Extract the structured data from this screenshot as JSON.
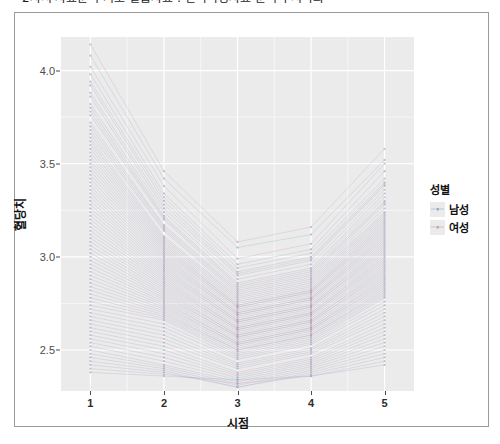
{
  "document": {
    "title_truncated": "2차시 자료분석 기초 실습자료 : 반복측정자료 분석과 시각화"
  },
  "figure": {
    "panel_background": "#ebebeb",
    "grid_color": "#ffffff",
    "border_color": "#9a9a9a"
  },
  "legend": {
    "title": "성별",
    "position": "right",
    "items": [
      {
        "label": "남성",
        "color": "#8aa8c8"
      },
      {
        "label": "여성",
        "color": "#c89aa8"
      }
    ]
  },
  "chart_data": {
    "type": "line",
    "title": "",
    "subtitle": "",
    "xlabel": "시점",
    "ylabel": "혈당치",
    "xlim": [
      0.6,
      5.4
    ],
    "ylim": [
      2.28,
      4.18
    ],
    "grid": true,
    "legend_position": "right",
    "x": [
      1,
      2,
      3,
      4,
      5
    ],
    "x_tick_labels": [
      "1",
      "2",
      "3",
      "4",
      "5"
    ],
    "y_ticks": [
      2.5,
      3.0,
      3.5,
      4.0
    ],
    "y_tick_labels": [
      "2.5",
      "3.0",
      "3.5",
      "4.0"
    ],
    "group_means": {
      "남성": [
        3.42,
        3.02,
        2.8,
        2.88,
        3.18
      ],
      "여성": [
        3.34,
        2.96,
        2.76,
        2.84,
        3.12
      ]
    },
    "series": [
      {
        "name": "남성",
        "values": [
          4.08,
          3.42,
          3.05,
          3.12,
          3.52
        ]
      },
      {
        "name": "남성",
        "values": [
          3.98,
          3.34,
          2.96,
          3.04,
          3.46
        ]
      },
      {
        "name": "남성",
        "values": [
          3.92,
          3.3,
          2.92,
          3.0,
          3.4
        ]
      },
      {
        "name": "남성",
        "values": [
          3.86,
          3.26,
          2.9,
          2.98,
          3.38
        ]
      },
      {
        "name": "남성",
        "values": [
          3.8,
          3.22,
          2.86,
          2.94,
          3.34
        ]
      },
      {
        "name": "남성",
        "values": [
          3.76,
          3.2,
          2.84,
          2.92,
          3.3
        ]
      },
      {
        "name": "남성",
        "values": [
          3.7,
          3.16,
          2.82,
          2.9,
          3.28
        ]
      },
      {
        "name": "남성",
        "values": [
          3.66,
          3.14,
          2.8,
          2.88,
          3.24
        ]
      },
      {
        "name": "남성",
        "values": [
          3.62,
          3.1,
          2.78,
          2.86,
          3.22
        ]
      },
      {
        "name": "남성",
        "values": [
          3.58,
          3.08,
          2.76,
          2.84,
          3.2
        ]
      },
      {
        "name": "남성",
        "values": [
          3.54,
          3.06,
          2.74,
          2.82,
          3.18
        ]
      },
      {
        "name": "남성",
        "values": [
          3.5,
          3.04,
          2.73,
          2.81,
          3.16
        ]
      },
      {
        "name": "남성",
        "values": [
          3.46,
          3.02,
          2.72,
          2.8,
          3.14
        ]
      },
      {
        "name": "남성",
        "values": [
          3.42,
          3.0,
          2.7,
          2.78,
          3.12
        ]
      },
      {
        "name": "남성",
        "values": [
          3.38,
          2.98,
          2.69,
          2.77,
          3.1
        ]
      },
      {
        "name": "남성",
        "values": [
          3.34,
          2.96,
          2.68,
          2.76,
          3.08
        ]
      },
      {
        "name": "남성",
        "values": [
          3.3,
          2.94,
          2.66,
          2.74,
          3.06
        ]
      },
      {
        "name": "남성",
        "values": [
          3.26,
          2.92,
          2.65,
          2.73,
          3.04
        ]
      },
      {
        "name": "남성",
        "values": [
          3.22,
          2.9,
          2.64,
          2.72,
          3.02
        ]
      },
      {
        "name": "남성",
        "values": [
          3.18,
          2.88,
          2.62,
          2.7,
          3.0
        ]
      },
      {
        "name": "남성",
        "values": [
          3.14,
          2.86,
          2.61,
          2.69,
          2.98
        ]
      },
      {
        "name": "남성",
        "values": [
          3.1,
          2.84,
          2.6,
          2.68,
          2.96
        ]
      },
      {
        "name": "남성",
        "values": [
          3.06,
          2.82,
          2.58,
          2.66,
          2.94
        ]
      },
      {
        "name": "남성",
        "values": [
          3.02,
          2.8,
          2.57,
          2.65,
          2.92
        ]
      },
      {
        "name": "남성",
        "values": [
          2.98,
          2.78,
          2.56,
          2.64,
          2.9
        ]
      },
      {
        "name": "남성",
        "values": [
          2.94,
          2.76,
          2.54,
          2.62,
          2.88
        ]
      },
      {
        "name": "남성",
        "values": [
          2.9,
          2.74,
          2.53,
          2.61,
          2.86
        ]
      },
      {
        "name": "남성",
        "values": [
          2.86,
          2.72,
          2.52,
          2.6,
          2.84
        ]
      },
      {
        "name": "남성",
        "values": [
          2.82,
          2.7,
          2.5,
          2.58,
          2.82
        ]
      },
      {
        "name": "남성",
        "values": [
          2.78,
          2.68,
          2.49,
          2.57,
          2.8
        ]
      },
      {
        "name": "여성",
        "values": [
          4.14,
          3.46,
          3.08,
          3.16,
          3.58
        ]
      },
      {
        "name": "여성",
        "values": [
          4.02,
          3.38,
          2.99,
          3.07,
          3.5
        ]
      },
      {
        "name": "여성",
        "values": [
          3.94,
          3.32,
          2.94,
          3.02,
          3.42
        ]
      },
      {
        "name": "여성",
        "values": [
          3.88,
          3.28,
          2.91,
          2.99,
          3.39
        ]
      },
      {
        "name": "여성",
        "values": [
          3.82,
          3.24,
          2.88,
          2.96,
          3.36
        ]
      },
      {
        "name": "여성",
        "values": [
          3.78,
          3.21,
          2.85,
          2.93,
          3.32
        ]
      },
      {
        "name": "여성",
        "values": [
          3.72,
          3.17,
          2.83,
          2.91,
          3.29
        ]
      },
      {
        "name": "여성",
        "values": [
          3.68,
          3.15,
          2.81,
          2.89,
          3.26
        ]
      },
      {
        "name": "여성",
        "values": [
          3.64,
          3.11,
          2.79,
          2.87,
          3.23
        ]
      },
      {
        "name": "여성",
        "values": [
          3.6,
          3.09,
          2.77,
          2.85,
          3.21
        ]
      },
      {
        "name": "여성",
        "values": [
          3.56,
          3.07,
          2.75,
          2.83,
          3.19
        ]
      },
      {
        "name": "여성",
        "values": [
          3.52,
          3.05,
          2.74,
          2.82,
          3.17
        ]
      },
      {
        "name": "여성",
        "values": [
          3.48,
          3.03,
          2.73,
          2.81,
          3.15
        ]
      },
      {
        "name": "여성",
        "values": [
          3.44,
          3.01,
          2.71,
          2.79,
          3.13
        ]
      },
      {
        "name": "여성",
        "values": [
          3.4,
          2.99,
          2.7,
          2.78,
          3.11
        ]
      },
      {
        "name": "여성",
        "values": [
          3.36,
          2.97,
          2.69,
          2.77,
          3.09
        ]
      },
      {
        "name": "여성",
        "values": [
          3.32,
          2.95,
          2.67,
          2.75,
          3.07
        ]
      },
      {
        "name": "여성",
        "values": [
          3.28,
          2.93,
          2.66,
          2.74,
          3.05
        ]
      },
      {
        "name": "여성",
        "values": [
          3.24,
          2.91,
          2.65,
          2.73,
          3.03
        ]
      },
      {
        "name": "여성",
        "values": [
          3.2,
          2.89,
          2.63,
          2.71,
          3.01
        ]
      },
      {
        "name": "여성",
        "values": [
          3.16,
          2.87,
          2.62,
          2.7,
          2.99
        ]
      },
      {
        "name": "여성",
        "values": [
          3.12,
          2.85,
          2.61,
          2.69,
          2.97
        ]
      },
      {
        "name": "여성",
        "values": [
          3.08,
          2.83,
          2.59,
          2.67,
          2.95
        ]
      },
      {
        "name": "여성",
        "values": [
          3.04,
          2.81,
          2.58,
          2.66,
          2.93
        ]
      },
      {
        "name": "여성",
        "values": [
          3.0,
          2.79,
          2.57,
          2.65,
          2.91
        ]
      },
      {
        "name": "여성",
        "values": [
          2.96,
          2.77,
          2.55,
          2.63,
          2.89
        ]
      },
      {
        "name": "여성",
        "values": [
          2.92,
          2.75,
          2.54,
          2.62,
          2.87
        ]
      },
      {
        "name": "여성",
        "values": [
          2.88,
          2.73,
          2.53,
          2.61,
          2.85
        ]
      },
      {
        "name": "여성",
        "values": [
          2.84,
          2.71,
          2.51,
          2.59,
          2.83
        ]
      },
      {
        "name": "여성",
        "values": [
          2.8,
          2.69,
          2.5,
          2.58,
          2.81
        ]
      },
      {
        "name": "여성",
        "values": [
          2.76,
          2.67,
          2.48,
          2.56,
          2.79
        ]
      },
      {
        "name": "남성",
        "values": [
          2.74,
          2.66,
          2.47,
          2.55,
          2.78
        ]
      },
      {
        "name": "여성",
        "values": [
          2.72,
          2.64,
          2.46,
          2.54,
          2.76
        ]
      },
      {
        "name": "남성",
        "values": [
          2.7,
          2.62,
          2.45,
          2.53,
          2.74
        ]
      },
      {
        "name": "여성",
        "values": [
          2.68,
          2.6,
          2.43,
          2.51,
          2.72
        ]
      },
      {
        "name": "남성",
        "values": [
          2.66,
          2.58,
          2.42,
          2.5,
          2.7
        ]
      },
      {
        "name": "여성",
        "values": [
          2.64,
          2.56,
          2.41,
          2.49,
          2.68
        ]
      },
      {
        "name": "남성",
        "values": [
          2.62,
          2.54,
          2.4,
          2.48,
          2.66
        ]
      },
      {
        "name": "여성",
        "values": [
          2.6,
          2.52,
          2.38,
          2.46,
          2.64
        ]
      },
      {
        "name": "남성",
        "values": [
          2.58,
          2.5,
          2.37,
          2.45,
          2.62
        ]
      },
      {
        "name": "여성",
        "values": [
          2.56,
          2.48,
          2.36,
          2.44,
          2.6
        ]
      },
      {
        "name": "남성",
        "values": [
          2.54,
          2.46,
          2.35,
          2.43,
          2.58
        ]
      },
      {
        "name": "여성",
        "values": [
          2.52,
          2.44,
          2.34,
          2.42,
          2.56
        ]
      },
      {
        "name": "남성",
        "values": [
          2.5,
          2.42,
          2.33,
          2.41,
          2.54
        ]
      },
      {
        "name": "여성",
        "values": [
          2.48,
          2.41,
          2.32,
          2.4,
          2.52
        ]
      },
      {
        "name": "남성",
        "values": [
          2.46,
          2.4,
          2.31,
          2.39,
          2.5
        ]
      },
      {
        "name": "여성",
        "values": [
          2.44,
          2.39,
          2.3,
          2.38,
          2.48
        ]
      },
      {
        "name": "남성",
        "values": [
          2.42,
          2.38,
          2.3,
          2.37,
          2.46
        ]
      },
      {
        "name": "여성",
        "values": [
          2.4,
          2.37,
          2.32,
          2.36,
          2.44
        ]
      },
      {
        "name": "남성",
        "values": [
          2.38,
          2.36,
          2.34,
          2.36,
          2.42
        ]
      }
    ]
  }
}
